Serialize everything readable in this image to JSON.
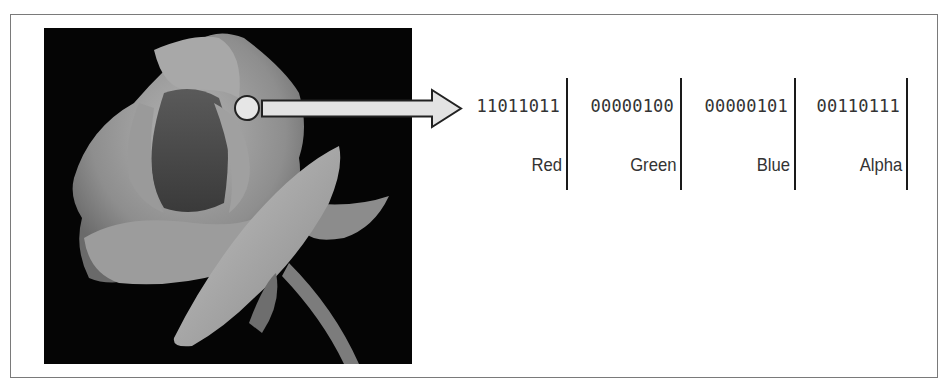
{
  "figure": {
    "pointer": {
      "shape": "circle-with-arrow",
      "fill": "#e3e3e3",
      "stroke": "#222222"
    },
    "channels": [
      {
        "bits": "11011011",
        "label": "Red"
      },
      {
        "bits": "00000100",
        "label": "Green"
      },
      {
        "bits": "00000101",
        "label": "Blue"
      },
      {
        "bits": "00110111",
        "label": "Alpha"
      }
    ]
  }
}
